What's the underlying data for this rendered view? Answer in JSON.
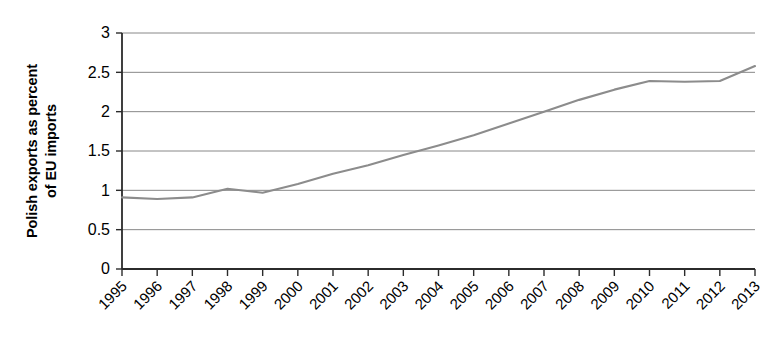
{
  "chart_data": {
    "type": "line",
    "title": "",
    "subtitle": "",
    "xlabel": "",
    "ylabel": "Polish exports as percent of EU imports",
    "ylabel_lines": [
      "Polish exports as percent",
      "of EU imports"
    ],
    "categories": [
      "1995",
      "1996",
      "1997",
      "1998",
      "1999",
      "2000",
      "2001",
      "2002",
      "2003",
      "2004",
      "2005",
      "2006",
      "2007",
      "2008",
      "2009",
      "2010",
      "2011",
      "2012",
      "2013"
    ],
    "x": [
      1995,
      1996,
      1997,
      1998,
      1999,
      2000,
      2001,
      2002,
      2003,
      2004,
      2005,
      2006,
      2007,
      2008,
      2009,
      2010,
      2011,
      2012,
      2013
    ],
    "values": [
      0.91,
      0.89,
      0.91,
      1.02,
      0.97,
      1.08,
      1.21,
      1.32,
      1.45,
      1.57,
      1.7,
      1.85,
      2.0,
      2.15,
      2.28,
      2.39,
      2.38,
      2.39,
      2.58
    ],
    "series": [
      {
        "name": "Polish exports as percent of EU imports",
        "values": [
          0.91,
          0.89,
          0.91,
          1.02,
          0.97,
          1.08,
          1.21,
          1.32,
          1.45,
          1.57,
          1.7,
          1.85,
          2.0,
          2.15,
          2.28,
          2.39,
          2.38,
          2.39,
          2.58
        ],
        "color": "#8c8c8c"
      }
    ],
    "ylim": [
      0,
      3
    ],
    "ytick_labels": [
      "0",
      "0.5",
      "1",
      "1.5",
      "2",
      "2.5",
      "3"
    ],
    "ytick_values": [
      0,
      0.5,
      1,
      1.5,
      2,
      2.5,
      3
    ],
    "grid": true,
    "grid_axis": "y",
    "legend": false,
    "legend_position": "none",
    "xtick_label_rotation": 45,
    "colors": {
      "series_line": "#8c8c8c",
      "gridline": "#7a7a7a",
      "axis": "#2b2b2b",
      "text": "#000000",
      "background": "#ffffff"
    }
  }
}
